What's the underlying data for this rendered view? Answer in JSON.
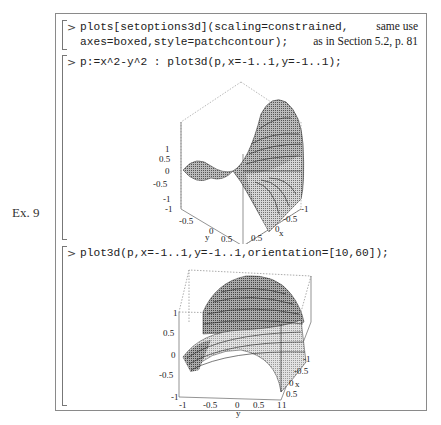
{
  "example_label": "Ex. 9",
  "margin_note": {
    "line1": "same use",
    "line2": "as in Section 5.2, p. 81"
  },
  "commands": [
    {
      "prompt": ">",
      "lines": [
        "plots[setoptions3d](scaling=constrained,",
        "axes=boxed,style=patchcontour);"
      ]
    },
    {
      "prompt": ">",
      "lines": [
        "p:=x^2-y^2 : plot3d(p,x=-1..1,y=-1..1);"
      ]
    },
    {
      "prompt": ">",
      "lines": [
        "plot3d(p,x=-1..1,y=-1..1,orientation=[10,60]);"
      ]
    }
  ],
  "plot1": {
    "z_ticks": [
      "1",
      "0.5",
      "0",
      "-0.5",
      "-1"
    ],
    "y_ticks": [
      "-1",
      "-0.5",
      "0",
      "0.5",
      "1"
    ],
    "y_label": "y",
    "x_ticks": [
      "-1",
      "-0.5",
      "0",
      "0.5",
      "1"
    ],
    "x_label": "x"
  },
  "plot2": {
    "z_ticks": [
      "1",
      "0.5",
      "0",
      "-0.5",
      "-1"
    ],
    "y_ticks": [
      "-1",
      "-0.5",
      "0",
      "0.5",
      "1"
    ],
    "y_label": "y",
    "x_ticks": [
      "-1",
      "-0.5",
      "0",
      "0.5",
      "1"
    ],
    "x_label": "x"
  }
}
